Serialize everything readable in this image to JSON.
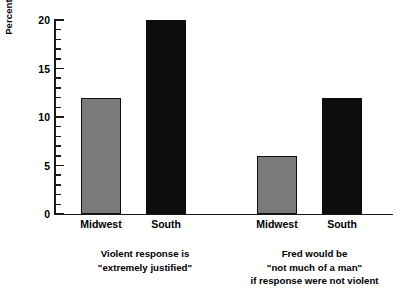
{
  "chart_data": {
    "type": "bar",
    "title": "",
    "subtitle": "",
    "xlabel": "",
    "ylabel": "Percent Who Agree with Statement",
    "ylim": [
      0,
      20
    ],
    "ytick_labels": [
      "0",
      "5",
      "10",
      "15",
      "20"
    ],
    "ytick_values": [
      0,
      5,
      10,
      15,
      20
    ],
    "yminor_step": 1,
    "grid": false,
    "legend": "none",
    "categories": [
      "Midwest",
      "South"
    ],
    "series": [
      {
        "name": "Midwest",
        "color": "#7a7a7a",
        "values": [
          12,
          6
        ]
      },
      {
        "name": "South",
        "color": "#0d0d0d",
        "values": [
          20,
          12
        ]
      }
    ],
    "groups": [
      {
        "caption_lines": [
          "Violent response is",
          "\"extremely justified\""
        ],
        "bars": [
          {
            "category": "Midwest",
            "value": 12,
            "color": "#7a7a7a",
            "style": "gray"
          },
          {
            "category": "South",
            "value": 20,
            "color": "#0d0d0d",
            "style": "black"
          }
        ]
      },
      {
        "caption_lines": [
          "Fred would be",
          "\"not much of a man\"",
          "if response were not violent"
        ],
        "bars": [
          {
            "category": "Midwest",
            "value": 6,
            "color": "#7a7a7a",
            "style": "gray"
          },
          {
            "category": "South",
            "value": 12,
            "color": "#0d0d0d",
            "style": "black"
          }
        ]
      }
    ],
    "colors": {
      "midwest_gray": "#7a7a7a",
      "south_black": "#0d0d0d",
      "axis": "#1a1a1a",
      "background": "#ffffff",
      "text": "#000000"
    }
  },
  "axis": {
    "y_title": "Percent Who Agree with Statement",
    "ticks": [
      {
        "label": "20",
        "value": 20
      },
      {
        "label": "15",
        "value": 15
      },
      {
        "label": "10",
        "value": 10
      },
      {
        "label": "5",
        "value": 5
      },
      {
        "label": "0",
        "value": 0
      }
    ]
  },
  "labels": {
    "g1_cat1": "Midwest",
    "g1_cat2": "South",
    "g2_cat1": "Midwest",
    "g2_cat2": "South",
    "g1_line1": "Violent response is",
    "g1_line2": "\"extremely justified\"",
    "g2_line1": "Fred would be",
    "g2_line2": "\"not much of a man\"",
    "g2_line3": "if response were not violent"
  }
}
